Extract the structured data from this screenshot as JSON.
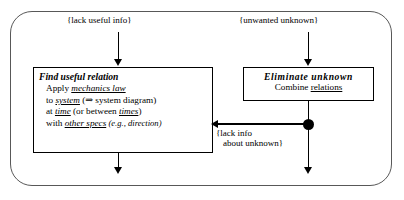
{
  "diagram": {
    "outer_frame": {
      "name": "activity-partition-frame"
    },
    "guards": {
      "lack_useful_info": "{lack useful info}",
      "unwanted_unknown": "{unwanted unknown}",
      "lack_info_about_unknown_line1": "{lack info",
      "lack_info_about_unknown_line2": "about unknown}"
    },
    "boxes": [
      {
        "id": "find-useful-relation",
        "title": "Find useful relation",
        "lines": [
          {
            "id": "apply",
            "prefix": "Apply ",
            "emph": "mechanics law",
            "suffix": ""
          },
          {
            "id": "to-system",
            "prefix": "to ",
            "emph": "system",
            "suffix": "  (⇒ system diagram)"
          },
          {
            "id": "at-time",
            "prefix": "at ",
            "emph": "time",
            "mid": " (or between ",
            "emph2": "times",
            "suffix": ")"
          },
          {
            "id": "with-other-specs",
            "prefix": "with ",
            "emph": "other specs",
            "suffix": " (e.g., direction)"
          }
        ]
      },
      {
        "id": "eliminate-unknown",
        "title": "Eliminate  unknown",
        "lines": [
          {
            "id": "combine",
            "prefix": "Combine ",
            "emph": "relations",
            "suffix": ""
          }
        ]
      }
    ],
    "connectors": [
      {
        "id": "in-find",
        "type": "arrow-down",
        "from": "top",
        "to": "find-useful-relation"
      },
      {
        "id": "in-eliminate",
        "type": "arrow-down",
        "from": "top",
        "to": "eliminate-unknown"
      },
      {
        "id": "out-find",
        "type": "arrow-down",
        "from": "find-useful-relation",
        "to": "bottom"
      },
      {
        "id": "out-eliminate",
        "type": "arrow-down",
        "from": "junction",
        "to": "bottom"
      },
      {
        "id": "feedback",
        "type": "arrow-left",
        "from": "junction",
        "to": "find-useful-relation"
      }
    ],
    "colors": {
      "stroke": "#000000",
      "frame": "#585858",
      "background": "#ffffff"
    }
  }
}
